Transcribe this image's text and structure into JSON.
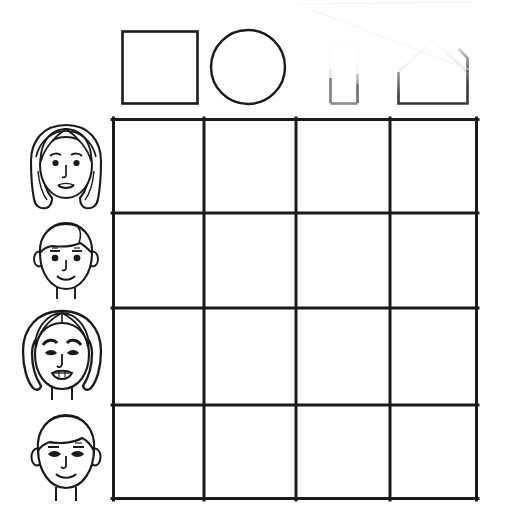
{
  "worksheet": {
    "title": "Shape and Face Matching Grid Worksheet",
    "description": "A blank four-by-four matching grid with four geometric shape headers across the top and four children's face portraits down the left column.",
    "background_color": "#ffffff",
    "ink_color": "#1a1a1a",
    "faded_ink_color": "#d8d8d8"
  },
  "grid": {
    "name": "matching-grid",
    "rows": 4,
    "columns": 4,
    "left": 112,
    "top": 118,
    "right": 478,
    "bottom": 500,
    "column_lines": [
      112,
      204,
      296,
      390,
      478
    ],
    "row_lines": [
      118,
      213,
      308,
      405,
      500
    ],
    "border_color": "#1a1a1a",
    "border_width": 3,
    "cell_fill": "#ffffff",
    "cells": [
      {
        "row": 1,
        "column": 1,
        "value": ""
      },
      {
        "row": 1,
        "column": 2,
        "value": ""
      },
      {
        "row": 1,
        "column": 3,
        "value": ""
      },
      {
        "row": 1,
        "column": 4,
        "value": ""
      },
      {
        "row": 2,
        "column": 1,
        "value": ""
      },
      {
        "row": 2,
        "column": 2,
        "value": ""
      },
      {
        "row": 2,
        "column": 3,
        "value": ""
      },
      {
        "row": 2,
        "column": 4,
        "value": ""
      },
      {
        "row": 3,
        "column": 1,
        "value": ""
      },
      {
        "row": 3,
        "column": 2,
        "value": ""
      },
      {
        "row": 3,
        "column": 3,
        "value": ""
      },
      {
        "row": 3,
        "column": 4,
        "value": ""
      },
      {
        "row": 4,
        "column": 1,
        "value": ""
      },
      {
        "row": 4,
        "column": 2,
        "value": ""
      },
      {
        "row": 4,
        "column": 3,
        "value": ""
      },
      {
        "row": 4,
        "column": 4,
        "value": ""
      }
    ]
  },
  "column_headers": [
    {
      "index": 1,
      "icon": "square-shape-icon",
      "label": "Square",
      "left": 122,
      "top": 31,
      "width": 75,
      "height": 72,
      "faded": false
    },
    {
      "index": 2,
      "icon": "circle-shape-icon",
      "label": "Circle",
      "center_x": 248,
      "center_y": 67,
      "radius": 37,
      "faded": false
    },
    {
      "index": 3,
      "icon": "rectangle-shape-icon",
      "label": "Rectangle",
      "left": 330,
      "top": 42,
      "width": 28,
      "height": 61,
      "faded": true,
      "fade_note": "Upper portion washed out by paper overlay"
    },
    {
      "index": 4,
      "icon": "house-pentagon-shape-icon",
      "label": "House",
      "left": 398,
      "top": 40,
      "width": 70,
      "height": 63,
      "faded": true,
      "fade_note": "Roof washed out by paper overlay; notch visible at top right"
    }
  ],
  "row_headers": [
    {
      "index": 1,
      "icon": "face-girl-long-hair-icon",
      "label": "Girl with shoulder-length hair",
      "center_x": 66,
      "center_y": 167,
      "features": [
        "center-parted hair",
        "headband line",
        "eyebrows",
        "eyes",
        "nose",
        "closed smile"
      ]
    },
    {
      "index": 2,
      "icon": "face-boy-short-hair-icon",
      "label": "Boy with short hair",
      "center_x": 66,
      "center_y": 259,
      "features": [
        "short hair",
        "ears",
        "eyebrows",
        "eyes",
        "nose",
        "closed smile",
        "neck"
      ]
    },
    {
      "index": 3,
      "icon": "face-girl-bob-hair-icon",
      "label": "Girl with bob haircut",
      "center_x": 62,
      "center_y": 355,
      "features": [
        "bob hair",
        "arched eyebrows",
        "lidded eyes",
        "nose",
        "open smile with teeth",
        "neck"
      ]
    },
    {
      "index": 4,
      "icon": "face-boy-fringe-hair-icon",
      "label": "Boy with fringe",
      "center_x": 66,
      "center_y": 455,
      "features": [
        "fringe hair",
        "ears",
        "eyebrows",
        "eyes",
        "nose",
        "closed smile",
        "neck"
      ]
    }
  ],
  "overlay": {
    "name": "paper-scan-wash",
    "description": "Faint translucent white paper edge overlapping the top-right corner of the scan",
    "visible": true
  }
}
